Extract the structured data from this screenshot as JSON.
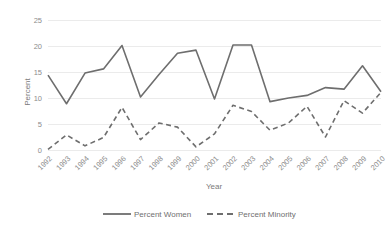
{
  "chart_data": {
    "type": "line",
    "title": "",
    "xlabel": "Year",
    "ylabel": "Percent",
    "categories": [
      "1992",
      "1993",
      "1994",
      "1995",
      "1996",
      "1997",
      "1998",
      "1999",
      "2000",
      "2001",
      "2002",
      "2003",
      "2004",
      "2005",
      "2006",
      "2007",
      "2008",
      "2009",
      "2010"
    ],
    "ylim": [
      0,
      25
    ],
    "yticks": [
      0,
      5,
      10,
      15,
      20,
      25
    ],
    "ytick_labels": [
      "0",
      "5",
      "10",
      "15",
      "20",
      "25"
    ],
    "grid": true,
    "legend_position": "bottom",
    "xtick_rotation": 45,
    "series": [
      {
        "name": "Percent Women",
        "style": "solid",
        "color": "#6e6e6e",
        "values": [
          14.4,
          8.9,
          14.8,
          15.6,
          20.1,
          10.2,
          14.5,
          18.6,
          19.2,
          9.8,
          20.2,
          20.2,
          9.3,
          10.0,
          10.5,
          12.0,
          11.7,
          16.2,
          11.2
        ]
      },
      {
        "name": "Percent Minority",
        "style": "dashed",
        "color": "#6e6e6e",
        "values": [
          0.1,
          2.9,
          0.8,
          2.4,
          8.2,
          2.0,
          5.2,
          4.4,
          0.6,
          3.1,
          8.6,
          7.4,
          3.8,
          5.2,
          8.4,
          2.5,
          9.5,
          7.1,
          11.1
        ]
      }
    ]
  },
  "legend": {
    "items": [
      {
        "label": "Percent Women",
        "style": "solid"
      },
      {
        "label": "Percent Minority",
        "style": "dashed"
      }
    ]
  },
  "axes": {
    "y_title": "Percent",
    "x_title": "Year"
  }
}
